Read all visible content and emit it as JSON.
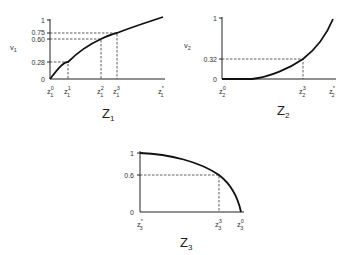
{
  "panels": [
    {
      "id": "z1",
      "title": "Z",
      "title_sub": "1",
      "yvar": "v",
      "yvar_sub": "1",
      "y_ticks": [
        "1",
        "0.75",
        "0.60",
        "0.28",
        "0"
      ],
      "x_ticks": [
        {
          "base": "z",
          "sub": "1",
          "sup": "0"
        },
        {
          "base": "z",
          "sub": "1",
          "sup": "1"
        },
        {
          "base": "z",
          "sub": "1",
          "sup": "2"
        },
        {
          "base": "z",
          "sub": "1",
          "sup": "3"
        },
        {
          "base": "z",
          "sub": "1",
          "sup": "*"
        }
      ]
    },
    {
      "id": "z2",
      "title": "Z",
      "title_sub": "2",
      "yvar": "v",
      "yvar_sub": "2",
      "y_ticks": [
        "1",
        "0.32",
        "0"
      ],
      "x_ticks": [
        {
          "base": "z",
          "sub": "2",
          "sup": "0"
        },
        {
          "base": "z",
          "sub": "2",
          "sup": "3"
        },
        {
          "base": "z",
          "sub": "2",
          "sup": "*"
        }
      ]
    },
    {
      "id": "z3",
      "title": "Z",
      "title_sub": "3",
      "y_ticks": [
        "1",
        "0.6",
        "0"
      ],
      "x_ticks": [
        {
          "base": "z",
          "sub": "3",
          "sup": "*"
        },
        {
          "base": "z",
          "sub": "3",
          "sup": "3"
        },
        {
          "base": "z",
          "sub": "3",
          "sup": "0"
        }
      ]
    }
  ]
}
